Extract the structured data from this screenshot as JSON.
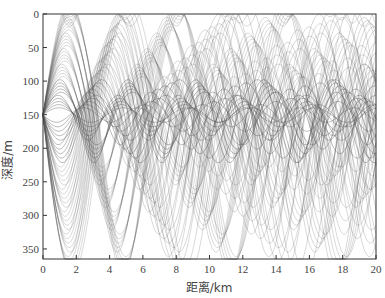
{
  "chart_data": {
    "type": "line",
    "title": "",
    "xlabel": "距离/km",
    "ylabel": "深度/m",
    "xlim": [
      0,
      20
    ],
    "ylim": [
      365,
      0
    ],
    "y_inverted": true,
    "x_ticks": [
      0,
      2,
      4,
      6,
      8,
      10,
      12,
      14,
      16,
      18,
      20
    ],
    "y_ticks": [
      0,
      50,
      100,
      150,
      200,
      250,
      300,
      350
    ],
    "grid": false,
    "legend": null,
    "source": {
      "x_km": 0,
      "depth_m": 150
    },
    "channel_axis_depth_m": 150,
    "line_color": "#555555"
  },
  "axes": {
    "x_label": "距离/km",
    "y_label": "深度/m"
  }
}
